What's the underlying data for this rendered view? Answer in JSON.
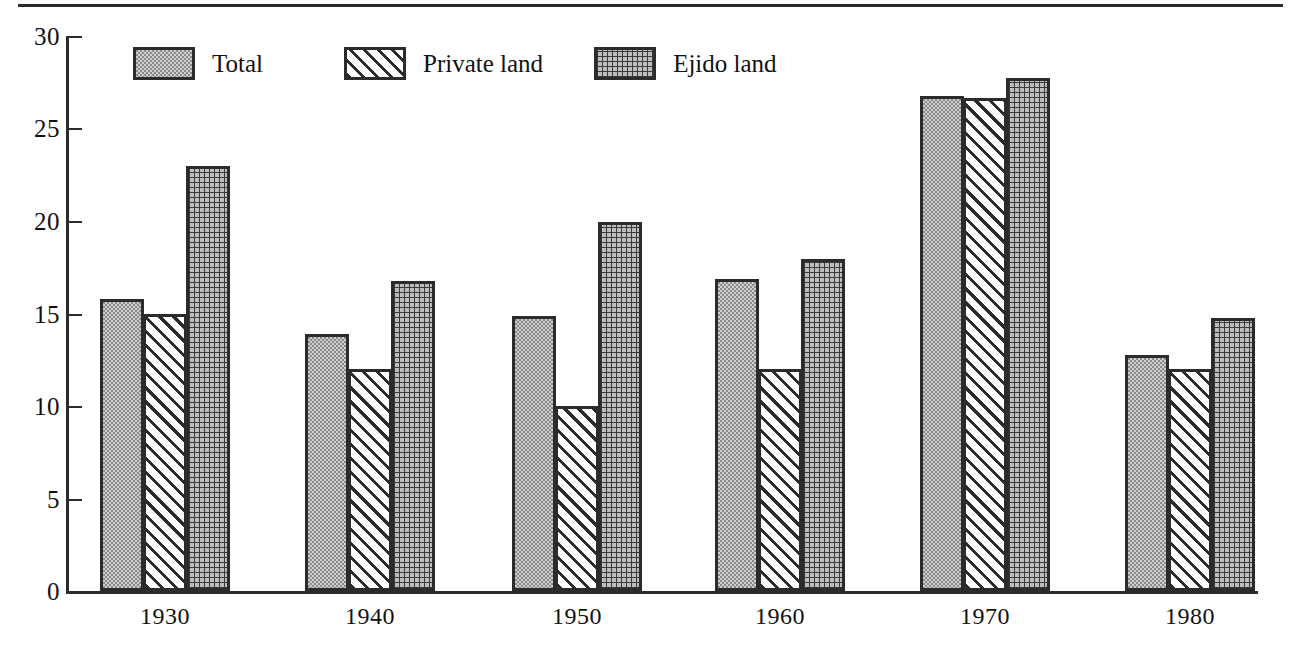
{
  "chart_data": {
    "type": "bar",
    "title": "",
    "subtitle": "",
    "xlabel": "",
    "ylabel": "",
    "categories": [
      "1930",
      "1940",
      "1950",
      "1960",
      "1970",
      "1980"
    ],
    "series": [
      {
        "name": "Total",
        "fill": "stipple",
        "values": [
          15.8,
          13.9,
          14.9,
          16.9,
          26.8,
          12.8
        ]
      },
      {
        "name": "Private land",
        "fill": "hatch-diag",
        "values": [
          15.0,
          12.0,
          10.0,
          12.0,
          26.7,
          12.0
        ]
      },
      {
        "name": "Ejido land",
        "fill": "crosshatch",
        "values": [
          23.0,
          16.8,
          20.0,
          18.0,
          27.8,
          14.8
        ]
      }
    ],
    "ylim": [
      0,
      30
    ],
    "yticks": [
      0,
      5,
      10,
      15,
      20,
      25,
      30
    ],
    "ytick_labels": [
      "0",
      "5",
      "10",
      "15",
      "20",
      "25",
      "30"
    ],
    "xtick_labels": [
      "1930",
      "1940",
      "1950",
      "1960",
      "1970",
      "1980"
    ],
    "grid": false,
    "legend_position": "top-left-inside",
    "legend_entries": [
      "Total",
      "Private land",
      "Ejido land"
    ],
    "colors": {
      "axis": "#2b2b2b",
      "text": "#111111",
      "total_fill": "#cfcfcf",
      "private_fill": "#ffffff",
      "ejido_fill": "#bdbdbd",
      "background": "#ffffff"
    }
  },
  "legend": {
    "items": [
      {
        "label": "Total"
      },
      {
        "label": "Private land"
      },
      {
        "label": "Ejido land"
      }
    ]
  },
  "axes": {
    "y_tick_labels": [
      "30",
      "25",
      "20",
      "15",
      "10",
      "5",
      "0"
    ],
    "x_tick_labels": [
      "1930",
      "1940",
      "1950",
      "1960",
      "1970",
      "1980"
    ]
  }
}
